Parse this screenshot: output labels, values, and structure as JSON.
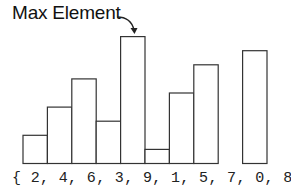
{
  "title": "Max Element",
  "array_text": "{ 2, 4, 6, 3, 9, 1, 5, 7, 0, 8 }",
  "values": [
    2,
    4,
    6,
    3,
    9,
    1,
    5,
    7,
    0,
    8
  ],
  "max_index": 4,
  "colors": {
    "stroke": "#333333",
    "text": "#111111",
    "background": "#ffffff"
  }
}
